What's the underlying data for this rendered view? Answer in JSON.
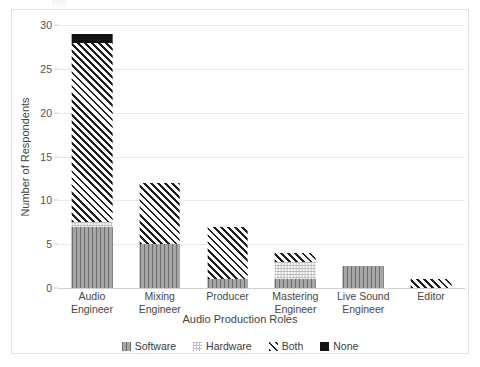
{
  "chart_data": {
    "type": "bar",
    "subtype": "stacked-bar",
    "title": "",
    "xlabel": "Audio Production Roles",
    "ylabel": "Number of Respondents",
    "ylim": [
      0,
      30
    ],
    "yticks": [
      0,
      5,
      10,
      15,
      20,
      25,
      30
    ],
    "ytick_labels": [
      "0",
      "5",
      "10",
      "15",
      "20",
      "25",
      "30"
    ],
    "grid": true,
    "legend_position": "bottom",
    "categories": [
      "Audio Engineer",
      "Mixing Engineer",
      "Producer",
      "Mastering Engineer",
      "Live Sound Engineer",
      "Editor"
    ],
    "category_label_lines": [
      [
        "Audio Engineer"
      ],
      [
        "Mixing",
        "Engineer"
      ],
      [
        "Producer"
      ],
      [
        "Mastering",
        "Engineer"
      ],
      [
        "Live Sound",
        "Engineer"
      ],
      [
        "Editor"
      ]
    ],
    "series": [
      {
        "name": "Software",
        "pattern": "vertical-lines",
        "color": "#8e8e8e",
        "values": [
          7,
          5,
          1,
          1,
          2.5,
          0
        ]
      },
      {
        "name": "Hardware",
        "pattern": "dotted-grid",
        "color": "#bdbdbd",
        "values": [
          0.5,
          0,
          0,
          2,
          0,
          0
        ]
      },
      {
        "name": "Both",
        "pattern": "diagonal-hatch",
        "color": "#1f1f1f",
        "values": [
          20.5,
          7,
          6,
          1,
          0,
          1
        ]
      },
      {
        "name": "None",
        "pattern": "solid-black",
        "color": "#111111",
        "values": [
          1,
          0,
          0,
          0,
          0,
          0
        ]
      }
    ],
    "totals": [
      29,
      12,
      7,
      4,
      2.5,
      1
    ]
  },
  "axes": {
    "y_title": "Number of Respondents",
    "x_title": "Audio Production Roles"
  },
  "legend": {
    "items": [
      {
        "label": "Software"
      },
      {
        "label": "Hardware"
      },
      {
        "label": "Both"
      },
      {
        "label": "None"
      }
    ]
  }
}
